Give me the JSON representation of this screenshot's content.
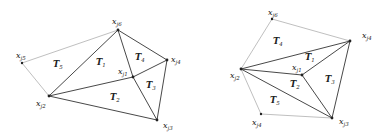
{
  "figures": [
    {
      "name": "left-star",
      "vertices": [
        {
          "id": "c",
          "var": "x",
          "sub": "j1"
        },
        {
          "id": "t",
          "var": "x",
          "sub": "j6"
        },
        {
          "id": "r",
          "var": "x",
          "sub": "j4"
        },
        {
          "id": "br",
          "var": "x",
          "sub": "j3"
        },
        {
          "id": "lb",
          "var": "x",
          "sub": "j2"
        },
        {
          "id": "fl",
          "var": "x",
          "sub": "j5"
        }
      ],
      "triangles": [
        {
          "var": "T",
          "sub": "1"
        },
        {
          "var": "T",
          "sub": "2"
        },
        {
          "var": "T",
          "sub": "3"
        },
        {
          "var": "T",
          "sub": "4"
        },
        {
          "var": "T",
          "sub": "5"
        }
      ]
    },
    {
      "name": "right-star",
      "vertices": [
        {
          "id": "c",
          "var": "x",
          "sub": "j1"
        },
        {
          "id": "t",
          "var": "x",
          "sub": "j6"
        },
        {
          "id": "r",
          "var": "x",
          "sub": "j4"
        },
        {
          "id": "br",
          "var": "x",
          "sub": "j3"
        },
        {
          "id": "bl",
          "var": "x",
          "sub": "j4"
        },
        {
          "id": "l",
          "var": "x",
          "sub": "j2"
        }
      ],
      "triangles": [
        {
          "var": "T",
          "sub": "1"
        },
        {
          "var": "T",
          "sub": "2"
        },
        {
          "var": "T",
          "sub": "3"
        },
        {
          "var": "T",
          "sub": "4"
        },
        {
          "var": "T",
          "sub": "5"
        }
      ]
    }
  ],
  "colors": {
    "edge_dark": "#333333",
    "edge_light": "#b8b8b8",
    "vertex": "#222222"
  }
}
